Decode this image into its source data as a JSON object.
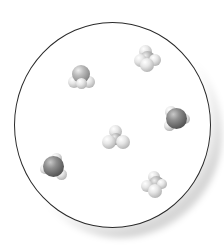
{
  "diagram": {
    "title": "",
    "container": {
      "shape": "circle",
      "border_color": "#2a2a2a",
      "fill": "#ffffff",
      "shadow": "bottom-right soft gray"
    },
    "colors": {
      "light_atom": "#e0e0e0",
      "medium_atom": "#9a9a9a",
      "dark_atom": "#555555"
    },
    "molecules": [
      {
        "id": "m1",
        "type": "trigonal-dark-top",
        "x": 82,
        "y": 77
      },
      {
        "id": "m2",
        "type": "light-cluster",
        "x": 147,
        "y": 58
      },
      {
        "id": "m3",
        "type": "dark-central",
        "x": 176,
        "y": 118
      },
      {
        "id": "m4",
        "type": "light-tetrahedral",
        "x": 115,
        "y": 137
      },
      {
        "id": "m5",
        "type": "dark-central",
        "x": 54,
        "y": 167
      },
      {
        "id": "m6",
        "type": "light-cluster",
        "x": 153,
        "y": 184
      }
    ]
  }
}
